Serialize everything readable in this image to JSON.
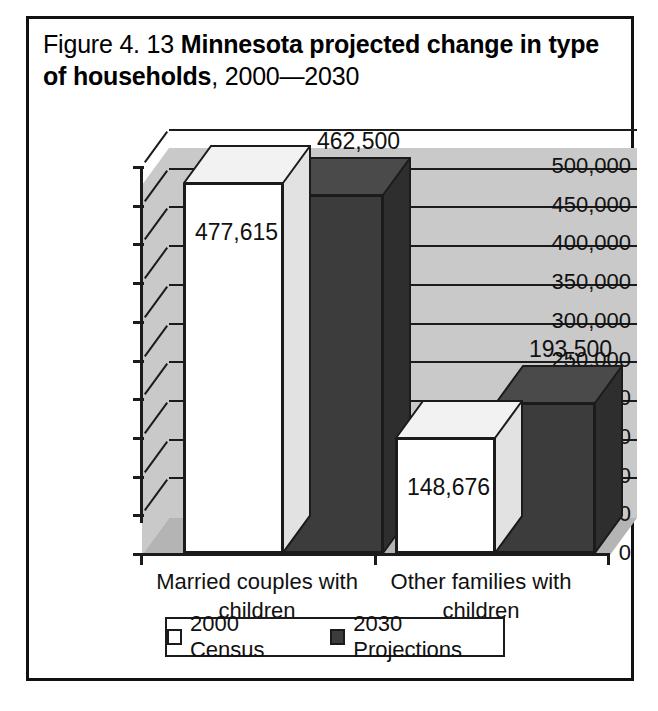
{
  "figure": {
    "title_prefix": "Figure 4. 13 ",
    "title_bold": "Minnesota projected change in type of households",
    "title_suffix": ", 2000—2030"
  },
  "chart_data": {
    "type": "bar",
    "title": "Figure 4. 13 Minnesota projected change in type of households, 2000—2030",
    "xlabel": "",
    "ylabel": "",
    "ylim": [
      0,
      500000
    ],
    "ytick_step": 50000,
    "grid": true,
    "legend_position": "bottom",
    "style": "3d-clustered-column",
    "categories": [
      "Married couples with children",
      "Other families with children"
    ],
    "series": [
      {
        "name": "2000 Census",
        "color": "#ffffff",
        "values": [
          477615,
          148676
        ],
        "labels": [
          "477,615",
          "148,676"
        ]
      },
      {
        "name": "2030 Projections",
        "color": "#3c3c3c",
        "values": [
          462500,
          193500
        ],
        "labels": [
          "462,500",
          "193,500"
        ]
      }
    ],
    "ytick_labels": [
      "500,000",
      "450,000",
      "400,000",
      "350,000",
      "300,000",
      "250,000",
      "200,000",
      "150,000",
      "100,000",
      "50,000",
      "0"
    ]
  },
  "axis": {
    "ticks": [
      {
        "label": "500,000",
        "value": 500000
      },
      {
        "label": "450,000",
        "value": 450000
      },
      {
        "label": "400,000",
        "value": 400000
      },
      {
        "label": "350,000",
        "value": 350000
      },
      {
        "label": "300,000",
        "value": 300000
      },
      {
        "label": "250,000",
        "value": 250000
      },
      {
        "label": "200,000",
        "value": 200000
      },
      {
        "label": "150,000",
        "value": 150000
      },
      {
        "label": "100,000",
        "value": 100000
      },
      {
        "label": "50,000",
        "value": 50000
      },
      {
        "label": "0",
        "value": 0
      }
    ]
  },
  "categories": [
    {
      "line1": "Married couples with",
      "line2": "children"
    },
    {
      "line1": "Other families with",
      "line2": "children"
    }
  ],
  "bars": [
    {
      "group": 0,
      "series": 0,
      "label": "477,615"
    },
    {
      "group": 0,
      "series": 1,
      "label": "462,500"
    },
    {
      "group": 1,
      "series": 0,
      "label": "148,676"
    },
    {
      "group": 1,
      "series": 1,
      "label": "193,500"
    }
  ],
  "legend": {
    "items": [
      {
        "label": "2000 Census",
        "color": "#ffffff"
      },
      {
        "label": "2030 Projections",
        "color": "#3c3c3c"
      }
    ]
  },
  "colors": {
    "wall": "#c9c9c9",
    "floor": "#b4b4b4",
    "gridline": "#1b1b1b",
    "series_light": "#ffffff",
    "series_dark": "#3c3c3c",
    "border": "#111111"
  }
}
